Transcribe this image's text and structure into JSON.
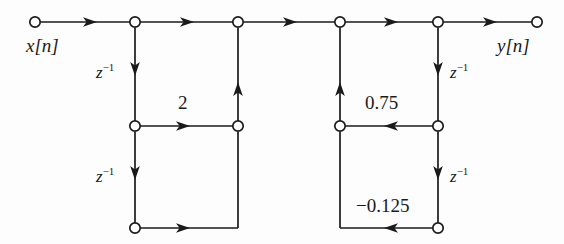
{
  "diagram": {
    "type": "signal-flow-graph",
    "stroke_color": "#1a1a1a",
    "node_fill": "#ffffff",
    "background": "#fdfdfd",
    "input_label": "x[n]",
    "output_label": "y[n]",
    "delay_symbol": "z",
    "delay_exponent": "−1",
    "labels": {
      "input": "x[n]",
      "output": "y[n]",
      "delay_left_upper": "z",
      "delay_left_lower": "z",
      "delay_right_upper": "z",
      "delay_right_lower": "z",
      "exponent": "−1",
      "coef_left_upper": "2",
      "coef_right_upper": "0.75",
      "coef_right_lower": "−0.125"
    },
    "coefficients": [
      {
        "name": "section1-feedback-1",
        "value": "2",
        "x": 185,
        "y": 103
      },
      {
        "name": "section2-feedback-1",
        "value": "0.75",
        "x": 390,
        "y": 103
      },
      {
        "name": "section2-feedback-2",
        "value": "−0.125",
        "x": 388,
        "y": 207
      }
    ],
    "nodes": [
      {
        "name": "input-node",
        "x": 35,
        "y": 22
      },
      {
        "name": "top-node-1",
        "x": 135,
        "y": 22
      },
      {
        "name": "top-node-2",
        "x": 238,
        "y": 22
      },
      {
        "name": "top-node-3",
        "x": 340,
        "y": 22
      },
      {
        "name": "top-node-4",
        "x": 438,
        "y": 22
      },
      {
        "name": "output-node",
        "x": 537,
        "y": 22
      },
      {
        "name": "mid-node-left-1",
        "x": 135,
        "y": 126
      },
      {
        "name": "mid-node-left-2",
        "x": 238,
        "y": 126
      },
      {
        "name": "mid-node-right-1",
        "x": 340,
        "y": 126
      },
      {
        "name": "mid-node-right-2",
        "x": 438,
        "y": 126
      },
      {
        "name": "bottom-node-left",
        "x": 135,
        "y": 228
      },
      {
        "name": "bottom-node-right",
        "x": 438,
        "y": 228
      }
    ]
  }
}
